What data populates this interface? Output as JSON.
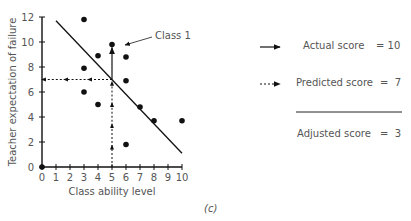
{
  "chart_data": {
    "type": "scatter",
    "title": "",
    "xlabel": "Class ability level",
    "ylabel": "Teacher expectation of failure",
    "xlim": [
      0,
      10
    ],
    "ylim": [
      0,
      12
    ],
    "x_ticks": [
      0,
      1,
      2,
      3,
      4,
      5,
      6,
      7,
      8,
      9,
      10
    ],
    "y_ticks": [
      0,
      2,
      4,
      6,
      8,
      10,
      12
    ],
    "grid": false,
    "points": [
      {
        "x": 0,
        "y": 0
      },
      {
        "x": 3,
        "y": 11.8
      },
      {
        "x": 5,
        "y": 9.8,
        "label": "Class 1"
      },
      {
        "x": 4,
        "y": 8.9
      },
      {
        "x": 6,
        "y": 8.8
      },
      {
        "x": 3,
        "y": 7.9
      },
      {
        "x": 6,
        "y": 6.9
      },
      {
        "x": 3,
        "y": 6.0
      },
      {
        "x": 4,
        "y": 5.0
      },
      {
        "x": 7,
        "y": 4.8
      },
      {
        "x": 8,
        "y": 3.7
      },
      {
        "x": 10,
        "y": 3.7
      },
      {
        "x": 6,
        "y": 1.8
      }
    ],
    "regression_line": {
      "x1": 1,
      "y1": 11.7,
      "x2": 10,
      "y2": 1.1
    },
    "annotations": {
      "class1_label": "Class 1",
      "predicted_path": {
        "from_x": 5,
        "to_y": 7,
        "style": "dashed-arrows"
      },
      "actual_path": {
        "x": 5,
        "from_y": 7,
        "to_y": 9.8,
        "style": "solid-arrow"
      }
    },
    "legend": [
      {
        "symbol": "solid-arrow",
        "label": "Actual score",
        "value": "= 10"
      },
      {
        "symbol": "dashed-arrow",
        "label": "Predicted score",
        "value": "=  7"
      },
      {
        "symbol": "none",
        "label": "Adjusted score",
        "value": "=  3"
      }
    ],
    "legend_position": "right",
    "panel_label": "(c)"
  },
  "labels": {
    "class1": "Class 1",
    "xlabel": "Class ability level",
    "ylabel": "Teacher expectation of failure",
    "panel": "(c)"
  },
  "legend": {
    "actual_label": "Actual score",
    "actual_value": "= 10",
    "predicted_label": "Predicted score",
    "predicted_value": "=  7",
    "adjusted_label": "Adjusted score",
    "adjusted_value": "=  3"
  }
}
